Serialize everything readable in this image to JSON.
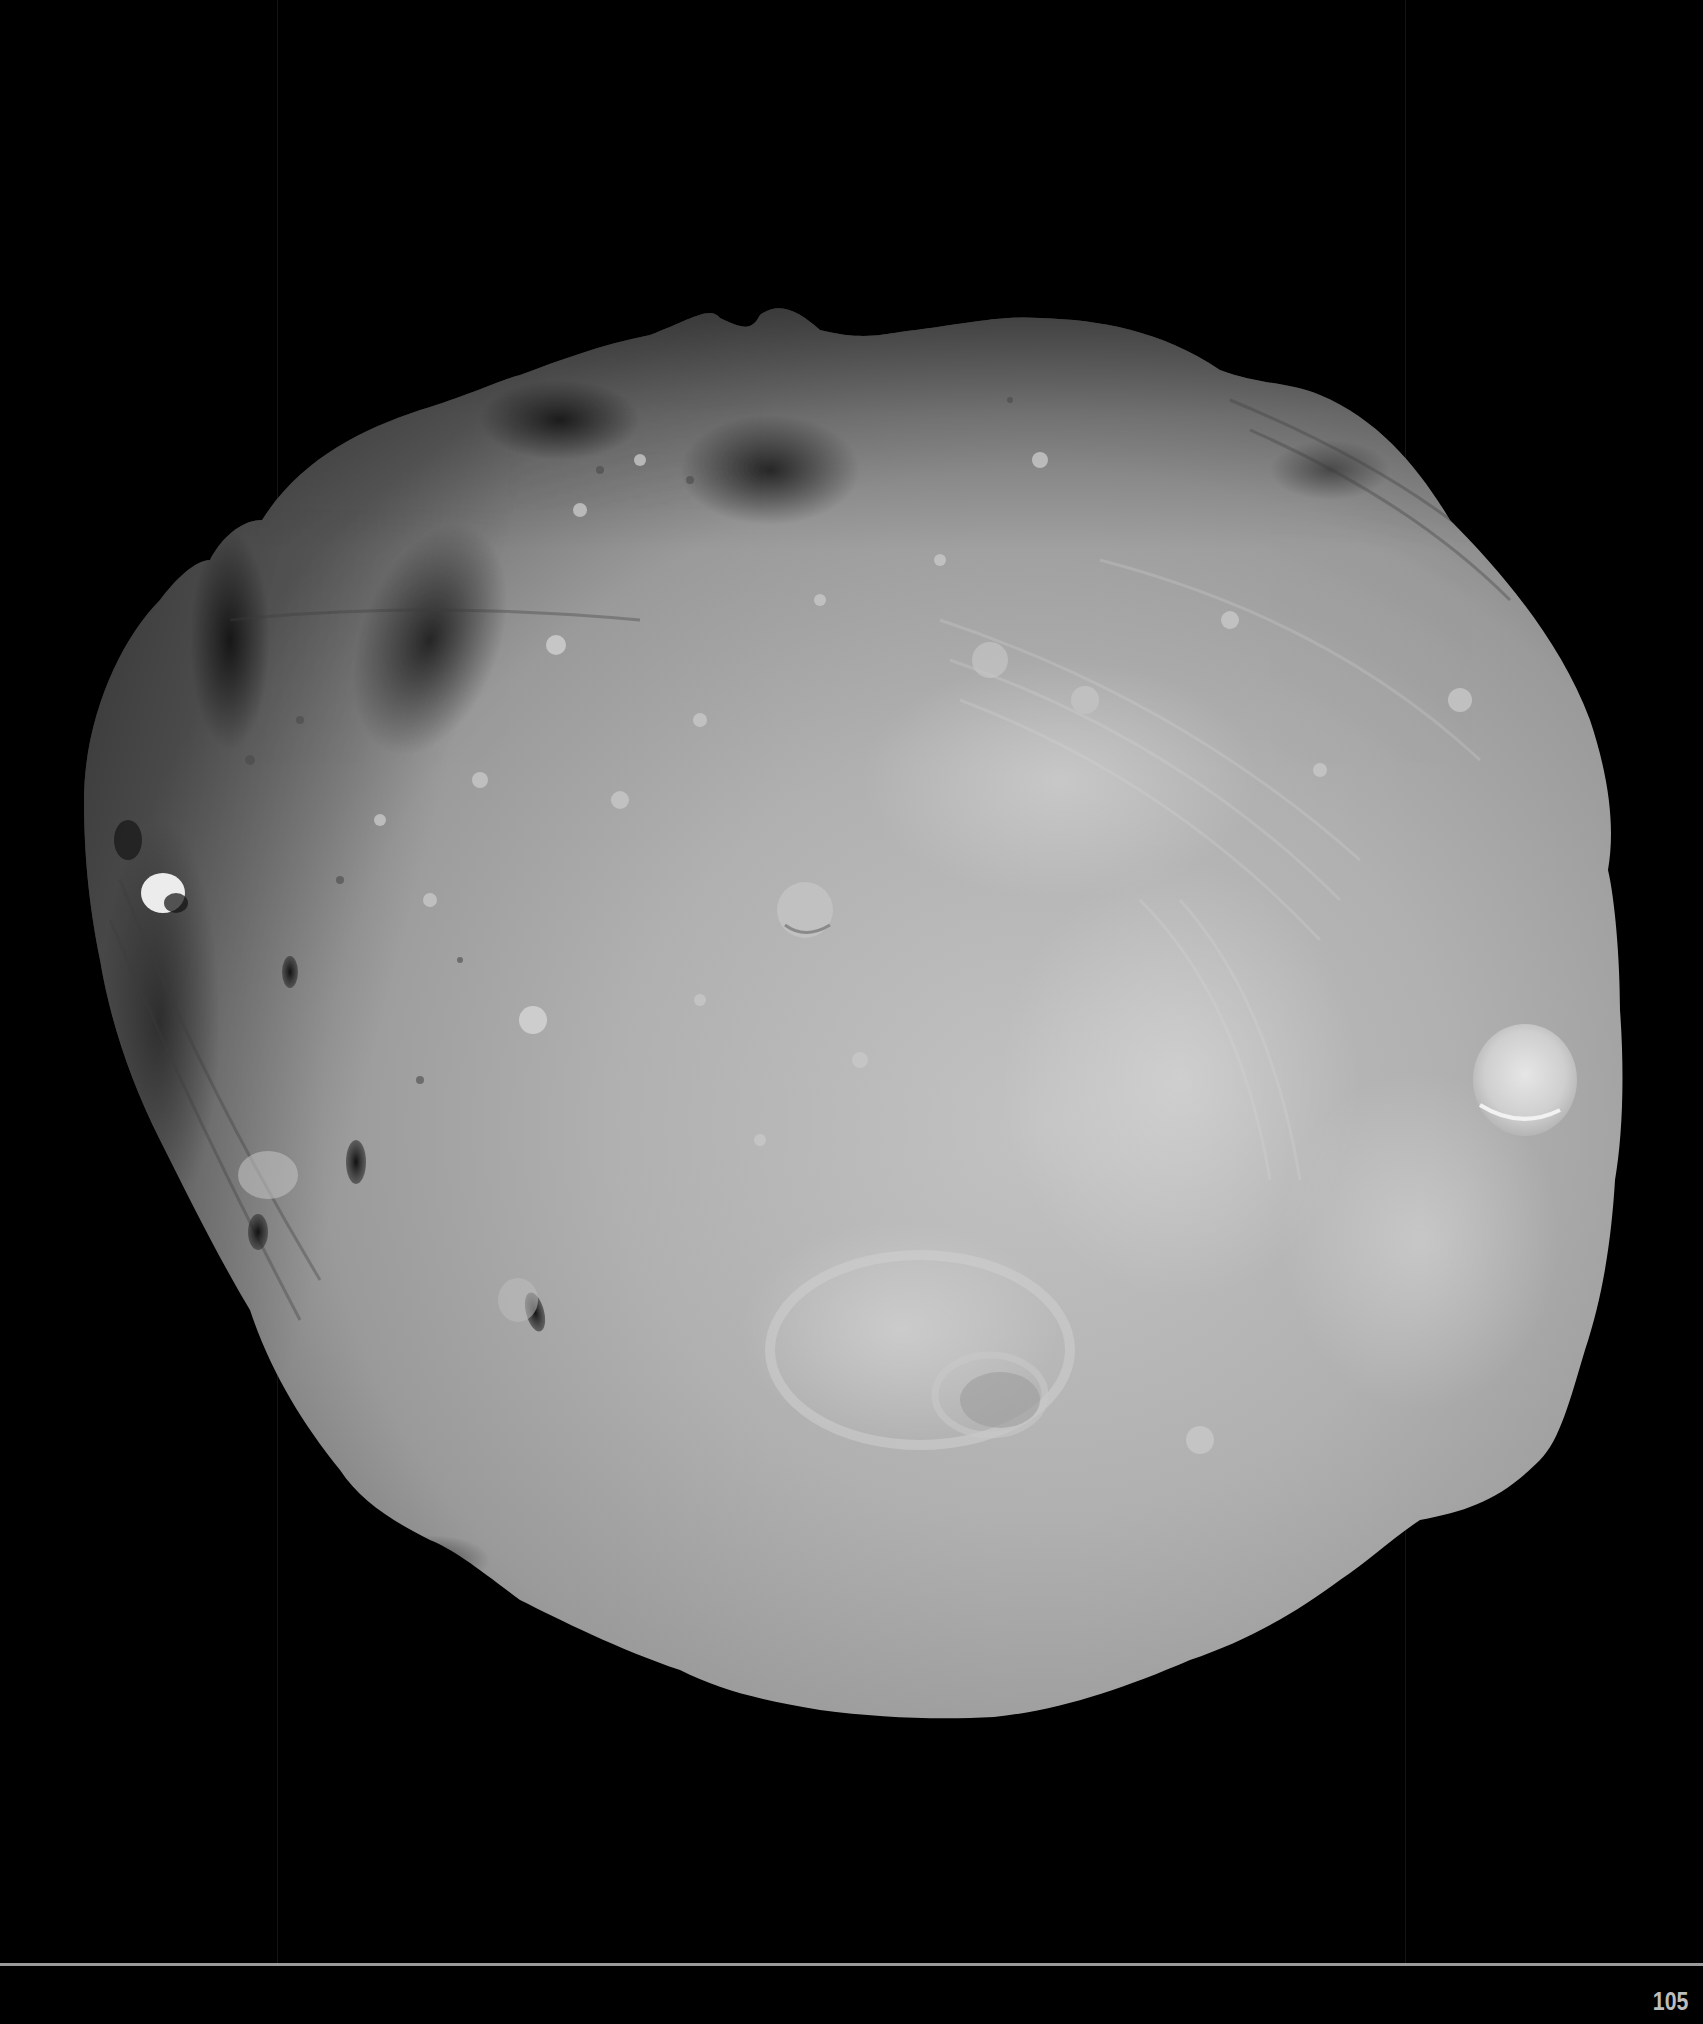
{
  "page": {
    "number": "105",
    "background_color": "#000000",
    "rule_color": "#9a9a9a",
    "page_number_color": "#bdbdbd"
  },
  "photo": {
    "subject": "irregular cratered moon (grayscale)",
    "surface_color": "#a9a9a9",
    "highlight_color": "#d0d0d0",
    "shadow_color": "#3a3a3a",
    "notable_features": [
      "large bright crater on right limb",
      "bright small crater on left side",
      "dark shadowed crater chain on upper-left",
      "parallel grooves across surface",
      "large rimmed crater near bottom center"
    ]
  }
}
